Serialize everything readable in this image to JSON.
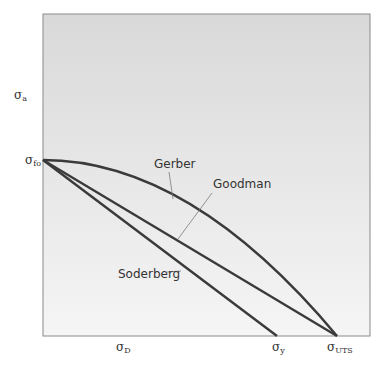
{
  "axes": {
    "y_label": "σ",
    "y_label_sub": "a",
    "x_ticks": [
      {
        "sym": "σ",
        "sub": "D"
      },
      {
        "sym": "σ",
        "sub": "y"
      },
      {
        "sym": "σ",
        "sub": "UTS"
      }
    ],
    "y_ticks": [
      {
        "sym": "σ",
        "sub": "fo"
      }
    ]
  },
  "curves": [
    {
      "name": "Gerber",
      "label": "Gerber",
      "shape": "parabolic",
      "from": "σfo",
      "to": "σUTS"
    },
    {
      "name": "Goodman",
      "label": "Goodman",
      "shape": "linear",
      "from": "σfo",
      "to": "σUTS"
    },
    {
      "name": "Soderberg",
      "label": "Soderberg",
      "shape": "linear",
      "from": "σfo",
      "to": "σy"
    }
  ],
  "colors": {
    "background": "#e6e6e6",
    "plot_fill_top": "#dcdcdc",
    "plot_fill_bottom": "#f4f4f4",
    "line": "#3a3a3a",
    "frame": "#8a8a8a",
    "leader": "#7a7a7a"
  }
}
